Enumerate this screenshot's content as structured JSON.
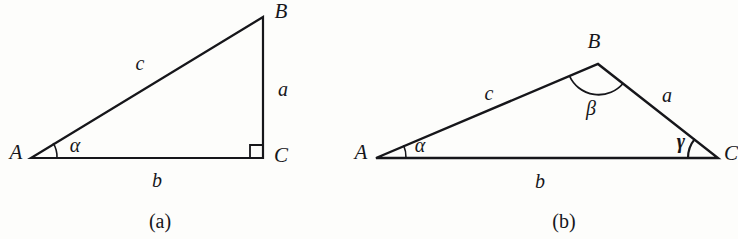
{
  "figure": {
    "background_color": "#fdfdfb",
    "stroke_color": "#16161a",
    "panels": [
      {
        "id": "panel-a",
        "caption": "(a)",
        "caption_pos": {
          "x": 160,
          "y": 221
        },
        "type": "right-triangle",
        "vertices": [
          {
            "name": "A",
            "label": "A",
            "x": 31,
            "y": 158,
            "label_x": 16,
            "label_y": 152
          },
          {
            "name": "B",
            "label": "B",
            "x": 263,
            "y": 17,
            "label_x": 281,
            "label_y": 11
          },
          {
            "name": "C",
            "label": "C",
            "x": 263,
            "y": 158,
            "label_x": 281,
            "label_y": 155
          }
        ],
        "sides": [
          {
            "name": "a",
            "label": "a",
            "between": "B-C",
            "x": 283,
            "y": 89
          },
          {
            "name": "b",
            "label": "b",
            "between": "A-C",
            "x": 157,
            "y": 180
          },
          {
            "name": "c",
            "label": "c",
            "between": "A-B",
            "x": 140,
            "y": 63
          }
        ],
        "angles": [
          {
            "name": "alpha",
            "label": "α",
            "at": "A",
            "x": 75,
            "y": 145,
            "bold": false,
            "marker": "arc",
            "radius": 26
          },
          {
            "name": "right-angle",
            "label": "",
            "at": "C",
            "bold": false,
            "marker": "square",
            "size": 13
          }
        ]
      },
      {
        "id": "panel-b",
        "caption": "(b)",
        "caption_pos": {
          "x": 564,
          "y": 221
        },
        "type": "oblique-triangle",
        "vertices": [
          {
            "name": "A",
            "label": "A",
            "x": 376,
            "y": 158,
            "label_x": 361,
            "label_y": 152
          },
          {
            "name": "B",
            "label": "B",
            "x": 598,
            "y": 64,
            "label_x": 594,
            "label_y": 41
          },
          {
            "name": "C",
            "label": "C",
            "x": 718,
            "y": 158,
            "label_x": 731,
            "label_y": 153
          }
        ],
        "sides": [
          {
            "name": "a",
            "label": "a",
            "between": "B-C",
            "x": 667,
            "y": 95
          },
          {
            "name": "b",
            "label": "b",
            "between": "A-C",
            "x": 540,
            "y": 181
          },
          {
            "name": "c",
            "label": "c",
            "between": "A-B",
            "x": 489,
            "y": 93
          }
        ],
        "angles": [
          {
            "name": "alpha",
            "label": "α",
            "at": "A",
            "x": 420,
            "y": 145,
            "bold": false,
            "marker": "arc",
            "radius": 30
          },
          {
            "name": "beta",
            "label": "β",
            "at": "B",
            "x": 591,
            "y": 108,
            "bold": false,
            "marker": "arc",
            "radius": 32
          },
          {
            "name": "gamma",
            "label": "γ",
            "at": "C",
            "x": 681,
            "y": 141,
            "bold": true,
            "marker": "arc",
            "radius": 30
          }
        ]
      }
    ]
  }
}
